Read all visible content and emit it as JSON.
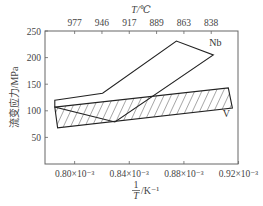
{
  "chart_data": {
    "type": "area",
    "title": "",
    "xlabel_numerator": "1",
    "xlabel_denominator": "T",
    "xlabel_unit": "/K⁻¹",
    "ylabel": "流变应力/MPa",
    "top_axis_label": "T/℃",
    "xlim": [
      0.7783,
      0.9196
    ],
    "ylim": [
      0,
      250
    ],
    "x_ticks": [
      0.8,
      0.84,
      0.88,
      0.92
    ],
    "x_tick_labels": [
      "0.80×10⁻³",
      "0.84×10⁻³",
      "0.88×10⁻³",
      "0.92×10⁻³"
    ],
    "y_ticks": [
      50,
      100,
      150,
      200,
      250
    ],
    "y_tick_labels": [
      "50",
      "100",
      "150",
      "200",
      "250"
    ],
    "top_ticks_x": [
      0.8,
      0.82,
      0.84,
      0.86,
      0.88,
      0.9
    ],
    "top_tick_labels": [
      "977",
      "946",
      "917",
      "889",
      "863",
      "838"
    ],
    "grid": false,
    "series": [
      {
        "name": "Nb",
        "fill": "none",
        "points": [
          [
            0.7855,
            120
          ],
          [
            0.8205,
            133
          ],
          [
            0.8745,
            231
          ],
          [
            0.9015,
            205
          ],
          [
            0.8295,
            79
          ],
          [
            0.7855,
            107
          ]
        ]
      },
      {
        "name": "V",
        "fill": "hatch",
        "points": [
          [
            0.7855,
            107
          ],
          [
            0.9125,
            143
          ],
          [
            0.9155,
            105
          ],
          [
            0.7875,
            68
          ]
        ]
      }
    ],
    "labels": [
      {
        "text": "Nb",
        "x": 0.903,
        "y": 222
      },
      {
        "text": "V",
        "x": 0.911,
        "y": 89
      }
    ]
  }
}
